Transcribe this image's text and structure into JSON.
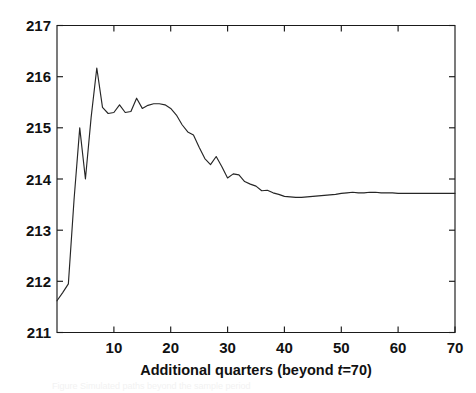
{
  "figure": {
    "background_color": "#ffffff",
    "line_color": "#262626",
    "axis_color": "#1a1a1a",
    "partial_caption": "Figure  Simulated paths beyond the sample period"
  },
  "chart_data": {
    "type": "line",
    "title": "",
    "xlabel": "Additional quarters (beyond t=70)",
    "xlabel_parts": {
      "before": "Additional quarters (beyond ",
      "italic": "t",
      "after": "=70)"
    },
    "ylabel": "",
    "xlim": [
      0,
      70
    ],
    "ylim": [
      211,
      217
    ],
    "grid": false,
    "legend": null,
    "xticks": [
      10,
      20,
      30,
      40,
      50,
      60,
      70
    ],
    "xtick_labels": [
      "10",
      "20",
      "30",
      "40",
      "50",
      "60",
      "70"
    ],
    "yticks": [
      211,
      212,
      213,
      214,
      215,
      216,
      217
    ],
    "ytick_labels": [
      "211",
      "212",
      "213",
      "214",
      "215",
      "216",
      "217"
    ],
    "series": [
      {
        "name": "forecast path",
        "x": [
          0,
          1,
          2,
          3,
          4,
          5,
          6,
          7,
          8,
          9,
          10,
          11,
          12,
          13,
          14,
          15,
          16,
          17,
          18,
          19,
          20,
          21,
          22,
          23,
          24,
          25,
          26,
          27,
          28,
          29,
          30,
          31,
          32,
          33,
          34,
          35,
          36,
          37,
          38,
          39,
          40,
          41,
          42,
          43,
          44,
          45,
          46,
          47,
          48,
          49,
          50,
          51,
          52,
          53,
          54,
          55,
          56,
          57,
          58,
          59,
          60,
          61,
          62,
          63,
          64,
          65,
          66,
          67,
          68,
          69,
          70
        ],
        "values": [
          211.62,
          211.78,
          211.95,
          213.6,
          215.0,
          214.0,
          215.2,
          216.17,
          215.4,
          215.28,
          215.3,
          215.45,
          215.3,
          215.32,
          215.58,
          215.38,
          215.44,
          215.47,
          215.47,
          215.45,
          215.38,
          215.25,
          215.06,
          214.92,
          214.86,
          214.62,
          214.4,
          214.28,
          214.44,
          214.24,
          214.02,
          214.1,
          214.08,
          213.95,
          213.9,
          213.86,
          213.77,
          213.78,
          213.73,
          213.7,
          213.66,
          213.65,
          213.64,
          213.64,
          213.65,
          213.66,
          213.67,
          213.68,
          213.69,
          213.7,
          213.72,
          213.73,
          213.74,
          213.73,
          213.73,
          213.74,
          213.74,
          213.73,
          213.73,
          213.73,
          213.72,
          213.72,
          213.72,
          213.72,
          213.72,
          213.72,
          213.72,
          213.72,
          213.72,
          213.72,
          213.72
        ]
      }
    ]
  }
}
